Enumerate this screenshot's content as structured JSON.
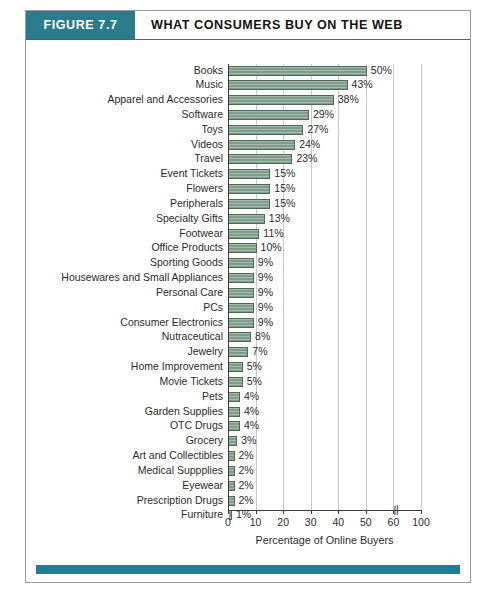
{
  "figure": {
    "tag": "FIGURE 7.7",
    "title": "WHAT CONSUMERS BUY ON THE WEB",
    "tag_color": "#2b7c8a",
    "rule_color": "#1d7f92",
    "bar_color": "#7f9d8b",
    "bar_edge_color": "#4e6a57",
    "grid_color": "#c9c9c9"
  },
  "chart_data": {
    "type": "bar",
    "orientation": "horizontal",
    "title": "WHAT CONSUMERS BUY ON THE WEB",
    "xlabel": "Percentage of Online Buyers",
    "ylabel": "",
    "xlim": [
      0,
      100
    ],
    "grid": true,
    "legend": null,
    "axis_break": {
      "present": true,
      "between": [
        60,
        100
      ],
      "marker": "//"
    },
    "xticks": [
      0,
      10,
      20,
      30,
      40,
      50,
      60,
      100
    ],
    "xtick_labels": [
      "0",
      "10",
      "20",
      "30",
      "40",
      "50",
      "60",
      "100"
    ],
    "value_suffix": "%",
    "categories": [
      "Books",
      "Music",
      "Apparel and Accessories",
      "Software",
      "Toys",
      "Videos",
      "Travel",
      "Event Tickets",
      "Flowers",
      "Peripherals",
      "Specialty Gifts",
      "Footwear",
      "Office Products",
      "Sporting Goods",
      "Housewares and Small Appliances",
      "Personal Care",
      "PCs",
      "Consumer Electronics",
      "Nutraceutical",
      "Jewelry",
      "Home Improvement",
      "Movie Tickets",
      "Pets",
      "Garden Supplies",
      "OTC Drugs",
      "Grocery",
      "Art and Collectibles",
      "Medical Suppplies",
      "Eyewear",
      "Prescription Drugs",
      "Furniture"
    ],
    "values": [
      50,
      43,
      38,
      29,
      27,
      24,
      23,
      15,
      15,
      15,
      13,
      11,
      10,
      9,
      9,
      9,
      9,
      9,
      8,
      7,
      5,
      5,
      4,
      4,
      4,
      3,
      2,
      2,
      2,
      2,
      1
    ],
    "value_labels": [
      "50%",
      "43%",
      "38%",
      "29%",
      "27%",
      "24%",
      "23%",
      "15%",
      "15%",
      "15%",
      "13%",
      "11%",
      "10%",
      "9%",
      "9%",
      "9%",
      "9%",
      "9%",
      "8%",
      "7%",
      "5%",
      "5%",
      "4%",
      "4%",
      "4%",
      "3%",
      "2%",
      "2%",
      "2%",
      "2%",
      "1%"
    ]
  },
  "caption": {
    "text": ""
  }
}
